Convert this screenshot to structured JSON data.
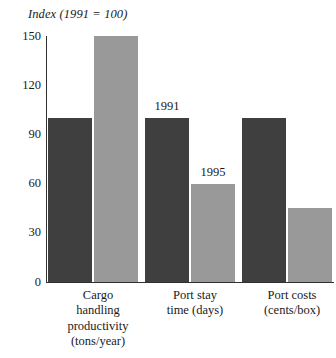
{
  "chart_data": {
    "type": "bar",
    "title": "Index (1991 = 100)",
    "xlabel": "",
    "ylabel": "",
    "ylim": [
      0,
      150
    ],
    "yticks": [
      0,
      30,
      60,
      90,
      120,
      150
    ],
    "grid": false,
    "legend": "inline-annotations",
    "categories": [
      "Cargo\nhandling\nproductivity\n(tons/year)",
      "Port stay\ntime (days)",
      "Port costs\n(cents/box)"
    ],
    "series": [
      {
        "name": "1991",
        "color": "#3f3f3f",
        "values": [
          100,
          100,
          100
        ]
      },
      {
        "name": "1995",
        "color": "#999999",
        "values": [
          150,
          60,
          45
        ]
      }
    ],
    "annotations": [
      {
        "text": "1991",
        "series": "1991",
        "category_index": 1
      },
      {
        "text": "1995",
        "series": "1995",
        "category_index": 1
      }
    ]
  },
  "axis": {
    "y_tick_labels": [
      "150",
      "120",
      "90",
      "60",
      "30",
      "0"
    ]
  },
  "colors": {
    "series_1991": "#3f3f3f",
    "series_1995": "#999999",
    "axis": "#30302f",
    "text": "#1a1a1a",
    "background": "#ffffff"
  }
}
